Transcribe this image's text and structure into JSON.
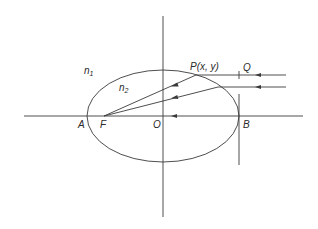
{
  "diagram": {
    "type": "ellipse-refraction",
    "stroke_color": "#3a3a3a",
    "background": "#ffffff",
    "labels": {
      "n1": {
        "base": "n",
        "sub": "1"
      },
      "n2": {
        "base": "n",
        "sub": "2"
      },
      "P": "P(x, y)",
      "Q": "Q",
      "A": "A",
      "F": "F",
      "O": "O",
      "B": "B"
    },
    "axes": {
      "horizontal": {
        "x1": 24,
        "y": 116,
        "x2": 303
      },
      "vertical": {
        "x": 163,
        "y1": 16,
        "y2": 217
      }
    },
    "ellipse": {
      "cx": 163,
      "cy": 116,
      "rx": 76,
      "ry": 46
    },
    "points": {
      "A": [
        87,
        116
      ],
      "F": [
        104,
        116
      ],
      "O": [
        163,
        116
      ],
      "B": [
        239,
        116
      ],
      "P": [
        196,
        75
      ],
      "Q": [
        239,
        75
      ]
    },
    "rays": [
      {
        "name": "incident-ray-1",
        "from": [
          286,
          75
        ],
        "to": [
          196,
          75
        ]
      },
      {
        "name": "incident-ray-2",
        "from": [
          286,
          87
        ],
        "to": [
          218,
          87
        ]
      },
      {
        "name": "refracted-ray-1",
        "from": [
          196,
          75
        ],
        "to": [
          104,
          116
        ]
      },
      {
        "name": "refracted-ray-2",
        "from": [
          218,
          87
        ],
        "to": [
          104,
          116
        ]
      }
    ],
    "tangent_at_B": {
      "x": 239,
      "y1": 94,
      "y2": 165
    },
    "q_tick": {
      "x": 239,
      "y1": 71,
      "y2": 79
    }
  }
}
